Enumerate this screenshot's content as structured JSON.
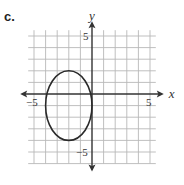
{
  "part_label": "c.",
  "chart_data": {
    "type": "line",
    "title": "",
    "xlabel": "x",
    "ylabel": "y",
    "xlim": [
      -5.5,
      5.5
    ],
    "ylim": [
      -6,
      5.5
    ],
    "grid": true,
    "grid_step": 1,
    "tick_labels": {
      "x": [
        {
          "value": -5,
          "label": "−5"
        },
        {
          "value": 5,
          "label": "5"
        }
      ],
      "y": [
        {
          "value": 5,
          "label": "5"
        },
        {
          "value": -5,
          "label": "−5"
        }
      ]
    },
    "series": [
      {
        "name": "ellipse",
        "shape": "ellipse",
        "center": [
          -2,
          -1
        ],
        "semi_axis_x": 2,
        "semi_axis_y": 3,
        "equation": "(x+2)^2/4 + (y+1)^2/9 = 1",
        "color": "#2a2a2a"
      }
    ],
    "colors": {
      "grid": "#b8b8b8",
      "axis": "#333333",
      "curve": "#2a2a2a"
    }
  }
}
